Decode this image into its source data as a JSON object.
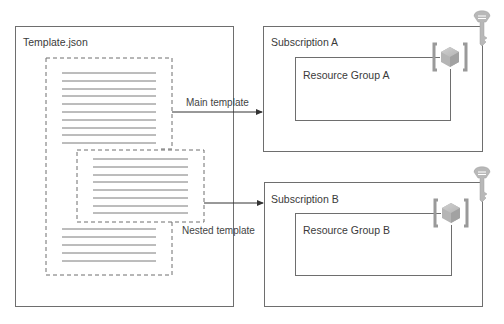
{
  "template_file": {
    "title": "Template.json",
    "main_template_lines": 10,
    "nested_template_lines": 8,
    "trailing_lines": 5
  },
  "connections": [
    {
      "label": "Main template",
      "target": "Subscription A"
    },
    {
      "label": "Nested template",
      "target": "Subscription B"
    }
  ],
  "subscriptions": [
    {
      "title": "Subscription A",
      "resource_group": "Resource Group A",
      "icon": "key-icon",
      "rg_icon": "resource-group-icon"
    },
    {
      "title": "Subscription B",
      "resource_group": "Resource Group B",
      "icon": "key-icon",
      "rg_icon": "resource-group-icon"
    }
  ],
  "colors": {
    "stroke": "#6e6e6e",
    "line": "#7a7a7a",
    "icon_gray": "#a8a8a8"
  }
}
